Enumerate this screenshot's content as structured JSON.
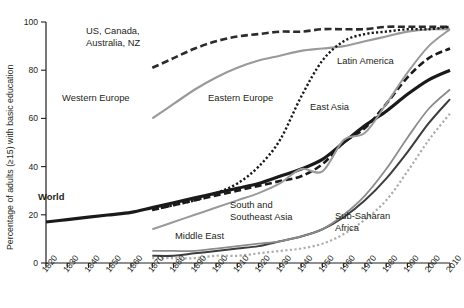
{
  "chart_data": {
    "type": "line",
    "title": "",
    "subtitle": "",
    "xlabel": "",
    "ylabel": "Percentage of adults (≥15) with basic education",
    "xlim": [
      1820,
      2010
    ],
    "ylim": [
      0,
      100
    ],
    "grid": false,
    "legend_position": "inline-annotations",
    "x_ticks": [
      "1820",
      "1830",
      "1840",
      "1850",
      "1860",
      "1870",
      "1880",
      "1890",
      "1900",
      "1910",
      "1920",
      "1930",
      "1940",
      "1950",
      "1960",
      "1970",
      "1980",
      "1990",
      "2000",
      "2010"
    ],
    "y_ticks": [
      "0",
      "20",
      "40",
      "60",
      "80",
      "100"
    ],
    "x": [
      1820,
      1830,
      1840,
      1850,
      1860,
      1870,
      1880,
      1890,
      1900,
      1910,
      1920,
      1930,
      1940,
      1950,
      1960,
      1970,
      1980,
      1990,
      2000,
      2010
    ],
    "series": [
      {
        "name": "World",
        "style": "solid-thick-black",
        "color": "#1a1a1a",
        "values": [
          17,
          18,
          19,
          20,
          21,
          23,
          25,
          27,
          29,
          31,
          33,
          36,
          39,
          43,
          50,
          57,
          63,
          70,
          76,
          80
        ]
      },
      {
        "name": "US, Canada, Australia, NZ",
        "style": "dashed-black",
        "color": "#2b2b2b",
        "values": [
          null,
          null,
          null,
          null,
          null,
          81,
          85,
          89,
          92,
          94,
          95,
          96,
          96,
          97,
          97,
          97,
          98,
          98,
          98,
          98
        ]
      },
      {
        "name": "Western Europe",
        "style": "solid-gray",
        "color": "#9a9a9a",
        "values": [
          null,
          null,
          null,
          null,
          null,
          60,
          66,
          72,
          77,
          81,
          84,
          86,
          88,
          89,
          90,
          92,
          94,
          96,
          97,
          97
        ]
      },
      {
        "name": "Eastern Europe",
        "style": "dotted-black",
        "color": "#1a1a1a",
        "values": [
          null,
          null,
          null,
          null,
          null,
          22,
          24,
          26,
          29,
          33,
          40,
          51,
          69,
          84,
          92,
          95,
          96,
          97,
          97,
          98
        ]
      },
      {
        "name": "Latin America",
        "style": "dashed-black",
        "color": "#1a1a1a",
        "values": [
          null,
          null,
          null,
          null,
          null,
          22,
          24,
          26,
          28,
          30,
          32,
          34,
          36,
          41,
          50,
          56,
          66,
          77,
          85,
          89
        ]
      },
      {
        "name": "East Asia",
        "style": "solid-gray-mid",
        "color": "#9a9a9a",
        "values": [
          null,
          null,
          null,
          null,
          null,
          14,
          17,
          20,
          23,
          26,
          29,
          33,
          39,
          38,
          51,
          54,
          66,
          79,
          90,
          97
        ]
      },
      {
        "name": "South and Southeast Asia",
        "style": "solid-dark",
        "color": "#3d3d3d",
        "values": [
          null,
          null,
          null,
          null,
          null,
          3,
          3,
          4,
          5,
          6,
          7,
          9,
          11,
          14,
          19,
          26,
          35,
          46,
          58,
          68
        ]
      },
      {
        "name": "Middle East",
        "style": "solid-gray-low",
        "color": "#8c8c8c",
        "values": [
          null,
          null,
          null,
          null,
          null,
          5,
          5,
          5,
          6,
          7,
          8,
          9,
          11,
          14,
          20,
          28,
          39,
          52,
          64,
          72
        ]
      },
      {
        "name": "Sub-Saharan Africa",
        "style": "dotted-gray",
        "color": "#adadad",
        "values": [
          null,
          null,
          null,
          null,
          null,
          2,
          2,
          2,
          3,
          3,
          4,
          5,
          6,
          8,
          12,
          18,
          26,
          38,
          51,
          62
        ]
      }
    ],
    "annotations": [
      {
        "text": "US, Canada,",
        "x_px": 86,
        "y_px": 34
      },
      {
        "text": "Australia, NZ",
        "x_px": 86,
        "y_px": 46
      },
      {
        "text": "Western Europe",
        "x_px": 62,
        "y_px": 101
      },
      {
        "text": "Eastern Europe",
        "x_px": 208,
        "y_px": 101
      },
      {
        "text": "Latin America",
        "x_px": 337,
        "y_px": 64
      },
      {
        "text": "East Asia",
        "x_px": 310,
        "y_px": 110
      },
      {
        "text": "World",
        "x_px": 38,
        "y_px": 200,
        "bold": true
      },
      {
        "text": "South and",
        "x_px": 230,
        "y_px": 208
      },
      {
        "text": "Southeast Asia",
        "x_px": 230,
        "y_px": 220
      },
      {
        "text": "Middle East",
        "x_px": 175,
        "y_px": 239
      },
      {
        "text": "Sub-Saharan",
        "x_px": 335,
        "y_px": 219
      },
      {
        "text": "Africa",
        "x_px": 335,
        "y_px": 231
      }
    ]
  },
  "axis": {
    "y_title": "Percentage of adults (≥15) with basic education"
  }
}
